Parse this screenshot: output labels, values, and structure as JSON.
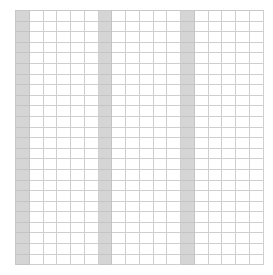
{
  "grid": {
    "columns": 18,
    "rows": 24,
    "shaded_columns": [
      0,
      6,
      12
    ],
    "colors": {
      "background": "#ffffff",
      "shaded": "#d5d5d5",
      "line": "#cfcfcf"
    }
  }
}
